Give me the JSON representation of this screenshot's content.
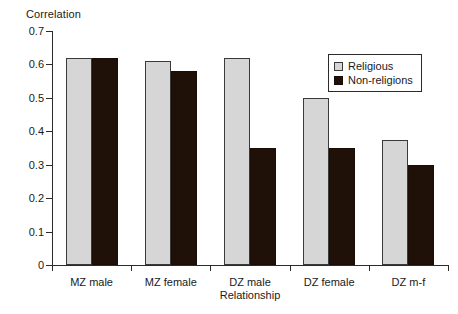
{
  "chart_data": {
    "type": "bar",
    "title": "",
    "subtitle": "",
    "ylabel": "Correlation",
    "xlabel": "Relationship",
    "categories": [
      "MZ male",
      "MZ female",
      "DZ male",
      "DZ female",
      "DZ m-f"
    ],
    "series": [
      {
        "name": "Religious",
        "color": "#d6d6d6",
        "values": [
          0.62,
          0.61,
          0.62,
          0.5,
          0.375
        ]
      },
      {
        "name": "Non-religions",
        "color": "#1f1008",
        "values": [
          0.62,
          0.58,
          0.35,
          0.35,
          0.3
        ]
      }
    ],
    "ylim": [
      0,
      0.7
    ],
    "ytick_values": [
      0,
      0.1,
      0.2,
      0.3,
      0.4,
      0.5,
      0.6,
      0.7
    ],
    "ytick_labels": [
      "0",
      "0.1",
      "0.2",
      "0.3",
      "0.4",
      "0.5",
      "0.6",
      "0.7"
    ],
    "grid": false,
    "legend_position": "top-right",
    "legend_entries": [
      "Religious",
      "Non-religions"
    ]
  }
}
